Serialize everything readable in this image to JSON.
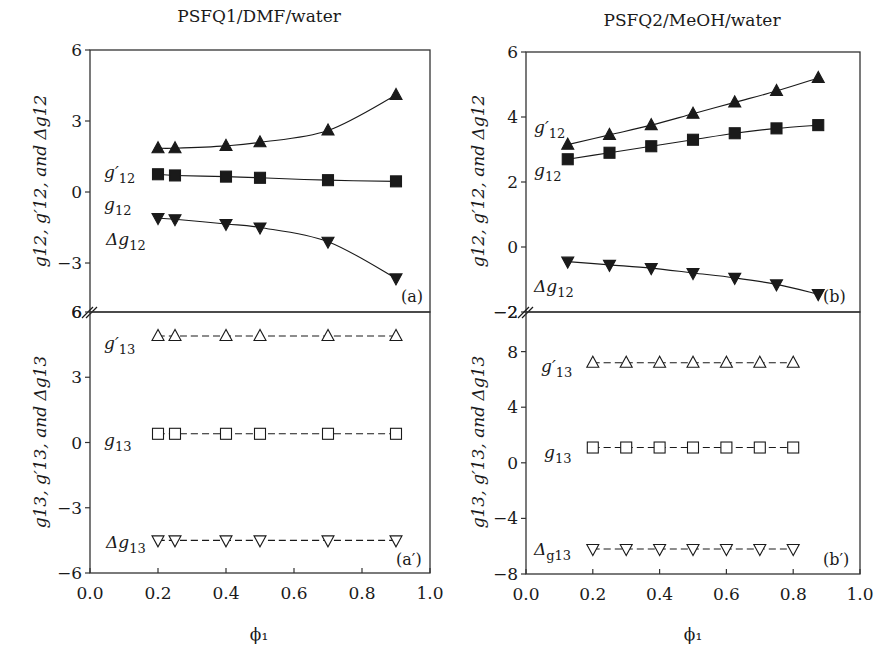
{
  "figure": {
    "left_title": "PSFQ1/DMF/water",
    "right_title": "PSFQ2/MeOH/water",
    "xlabel": "ϕ₁",
    "ylabel_upper": "g12, g′12, and Δg12",
    "ylabel_lower": "g13, g′13, and Δg13"
  },
  "chart_data": [
    {
      "panel": "(a)",
      "type": "line",
      "title": "PSFQ1/DMF/water",
      "xlabel": "ϕ₁",
      "ylabel": "g12, g′12, and Δg12",
      "xlim": [
        0.0,
        1.0
      ],
      "ylim": [
        -5.1,
        6
      ],
      "xticks": [
        "0.0",
        "0.2",
        "0.4",
        "0.6",
        "0.8",
        "1.0"
      ],
      "yticks": [
        "6",
        "3",
        "0",
        "-3"
      ],
      "x": [
        0.2,
        0.25,
        0.4,
        0.5,
        0.7,
        0.9
      ],
      "series": [
        {
          "name": "g′12",
          "marker": "filled-triangle-up",
          "line": "solid",
          "values": [
            1.85,
            1.85,
            1.95,
            2.1,
            2.6,
            4.1
          ]
        },
        {
          "name": "g12",
          "marker": "filled-square",
          "line": "solid",
          "values": [
            0.75,
            0.7,
            0.65,
            0.6,
            0.5,
            0.45
          ]
        },
        {
          "name": "Δg12",
          "marker": "filled-triangle-down",
          "line": "solid",
          "values": [
            -1.1,
            -1.15,
            -1.35,
            -1.5,
            -2.1,
            -3.65
          ]
        }
      ],
      "grid": false
    },
    {
      "panel": "(a′)",
      "type": "line",
      "xlabel": "ϕ₁",
      "ylabel": "g13, g′13, and Δg13",
      "xlim": [
        0.0,
        1.0
      ],
      "ylim": [
        -6,
        6
      ],
      "xticks": [
        "0.0",
        "0.2",
        "0.4",
        "0.6",
        "0.8",
        "1.0"
      ],
      "yticks": [
        "6",
        "3",
        "0",
        "-3",
        "-6"
      ],
      "x": [
        0.2,
        0.25,
        0.4,
        0.5,
        0.7,
        0.9
      ],
      "series": [
        {
          "name": "g′13",
          "marker": "open-triangle-up",
          "line": "dashed",
          "values": [
            4.9,
            4.9,
            4.9,
            4.9,
            4.9,
            4.9
          ]
        },
        {
          "name": "g13",
          "marker": "open-square",
          "line": "dashed",
          "values": [
            0.4,
            0.4,
            0.4,
            0.4,
            0.4,
            0.4
          ]
        },
        {
          "name": "Δg13",
          "marker": "open-triangle-down",
          "line": "dashed",
          "values": [
            -4.5,
            -4.5,
            -4.5,
            -4.5,
            -4.5,
            -4.5
          ]
        }
      ],
      "grid": false
    },
    {
      "panel": "(b)",
      "type": "line",
      "title": "PSFQ2/MeOH/water",
      "xlabel": "ϕ₁",
      "ylabel": "g12, g′12, and Δg12",
      "xlim": [
        0.0,
        1.0
      ],
      "ylim": [
        -2,
        6
      ],
      "xticks": [
        "0.0",
        "0.2",
        "0.4",
        "0.6",
        "0.8",
        "1.0"
      ],
      "yticks": [
        "6",
        "4",
        "2",
        "0",
        "-2"
      ],
      "x": [
        0.125,
        0.25,
        0.375,
        0.5,
        0.625,
        0.75,
        0.875
      ],
      "series": [
        {
          "name": "g′12",
          "marker": "filled-triangle-up",
          "line": "solid",
          "values": [
            3.15,
            3.45,
            3.75,
            4.1,
            4.45,
            4.8,
            5.2
          ]
        },
        {
          "name": "g12",
          "marker": "filled-square",
          "line": "solid",
          "values": [
            2.7,
            2.9,
            3.1,
            3.3,
            3.5,
            3.65,
            3.75
          ]
        },
        {
          "name": "Δg12",
          "marker": "filled-triangle-down",
          "line": "solid",
          "values": [
            -0.45,
            -0.55,
            -0.65,
            -0.8,
            -0.95,
            -1.15,
            -1.45
          ]
        }
      ],
      "grid": false
    },
    {
      "panel": "(b′)",
      "type": "line",
      "xlabel": "ϕ₁",
      "ylabel": "g13, g′13, and Δg13",
      "xlim": [
        0.0,
        1.0
      ],
      "ylim": [
        -8,
        10.9
      ],
      "xticks": [
        "0.0",
        "0.2",
        "0.4",
        "0.6",
        "0.8",
        "1.0"
      ],
      "yticks": [
        "8",
        "4",
        "0",
        "-4",
        "-8"
      ],
      "x": [
        0.2,
        0.3,
        0.4,
        0.5,
        0.6,
        0.7,
        0.8
      ],
      "series": [
        {
          "name": "g′13",
          "marker": "open-triangle-up",
          "line": "dashed",
          "values": [
            7.2,
            7.2,
            7.2,
            7.2,
            7.2,
            7.2,
            7.2
          ]
        },
        {
          "name": "g13",
          "marker": "open-square",
          "line": "dashed",
          "values": [
            1.1,
            1.1,
            1.1,
            1.1,
            1.1,
            1.1,
            1.1
          ]
        },
        {
          "name": "Δg13",
          "marker": "open-triangle-down",
          "line": "dashed",
          "values": [
            -6.2,
            -6.2,
            -6.2,
            -6.2,
            -6.2,
            -6.2,
            -6.2
          ]
        }
      ],
      "grid": false
    }
  ],
  "layout": {
    "ink": "#1a1a1a",
    "frame": "#333333",
    "panels": [
      {
        "x0": 90,
        "x1": 430,
        "y_top": 50,
        "y_bot": 312,
        "vmax": 6,
        "vmin": -5.07,
        "upper_tick_label_break": "6"
      },
      {
        "x0": 90,
        "x1": 430,
        "y_top": 312,
        "y_bot": 573,
        "vmax": 6,
        "vmin": -6
      },
      {
        "x0": 526,
        "x1": 860,
        "y_top": 52,
        "y_bot": 312,
        "vmax": 6,
        "vmin": -2
      },
      {
        "x0": 526,
        "x1": 860,
        "y_top": 312,
        "y_bot": 574,
        "vmax": 10.85,
        "vmin": -8
      }
    ],
    "labels": [
      [
        {
          "text": "g′",
          "sub": "12",
          "x": 104,
          "y": 178
        },
        {
          "text": "g",
          "sub": "12",
          "x": 104,
          "y": 210
        },
        {
          "text": "Δg",
          "sub": "12",
          "x": 106,
          "y": 245
        }
      ],
      [
        {
          "text": "g′",
          "sub": "13",
          "x": 104,
          "y": 349
        },
        {
          "text": "g",
          "sub": "13",
          "x": 104,
          "y": 446
        },
        {
          "text": "Δg",
          "sub": "13",
          "x": 106,
          "y": 548
        }
      ],
      [
        {
          "text": "g′",
          "sub": "12",
          "x": 534,
          "y": 133
        },
        {
          "text": "g",
          "sub": "12",
          "x": 534,
          "y": 176
        },
        {
          "text": "Δg",
          "sub": "12",
          "x": 534,
          "y": 292
        }
      ],
      [
        {
          "text": "g′",
          "sub": "13",
          "x": 541,
          "y": 372
        },
        {
          "text": "g",
          "sub": "13",
          "x": 544,
          "y": 458
        },
        {
          "text": "Δ",
          "sub": "g13",
          "x": 534,
          "y": 555
        }
      ]
    ],
    "tags": [
      {
        "text": "(a)",
        "x": 401,
        "y": 302
      },
      {
        "text": "(a′)",
        "x": 396,
        "y": 565
      },
      {
        "text": "(b)",
        "x": 823,
        "y": 302
      },
      {
        "text": "(b′)",
        "x": 823,
        "y": 565
      }
    ]
  }
}
